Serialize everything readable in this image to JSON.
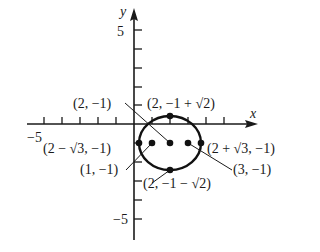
{
  "diagram": {
    "type": "ellipse-graph",
    "axes": {
      "x_label": "x",
      "y_label": "y",
      "x_tick_label": "−5",
      "y_tick_label_top": "5",
      "y_tick_label_bottom": "−5"
    },
    "ellipse": {
      "center": [
        2,
        -1
      ],
      "a": "√3",
      "b": "√2",
      "stroke_color": "#111111"
    },
    "labels": {
      "center": "(2, −1)",
      "top_vertex": "(2, −1 + √2)",
      "left_vertex": "(2 − √3, −1)",
      "right_vertex": "(2 + √3, −1)",
      "left_focus": "(1, −1)",
      "right_focus": "(3, −1)",
      "bottom_vertex": "(2, −1 − √2)"
    }
  }
}
